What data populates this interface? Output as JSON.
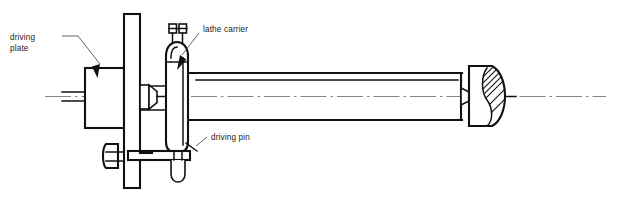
{
  "figure": {
    "type": "engineering-line-drawing",
    "width": 619,
    "height": 199,
    "background_color": "#ffffff",
    "line_color": "#111111",
    "centerline_color": "#777777",
    "leader_color": "#4a4a4a"
  },
  "labels": {
    "driving_plate": {
      "line1": "driving",
      "line2": "plate",
      "full": "driving plate",
      "x": 10,
      "y": 40
    },
    "lathe_carrier": {
      "full": "lathe carrier",
      "x": 203,
      "y": 32
    },
    "driving_pin": {
      "full": "driving pin",
      "x": 211,
      "y": 140
    }
  },
  "components": [
    {
      "name": "driving-plate",
      "description": "tall vertical faceplate mounted on the lathe spindle",
      "shape": "rectangle",
      "x": 124,
      "y": 14,
      "width": 16,
      "height": 174
    },
    {
      "name": "driving-plate-hub",
      "description": "cylindrical hub behind the faceplate",
      "shape": "rectangle",
      "x": 85,
      "y": 68,
      "width": 39,
      "height": 60
    },
    {
      "name": "headstock-center",
      "description": "conical dead center projecting from the spindle",
      "shape": "cone"
    },
    {
      "name": "lathe-carrier",
      "description": "lathe dog clamped onto the workpiece, rounded top body with two clamping screws",
      "shape": "rounded-body",
      "x": 166,
      "y": 43,
      "width": 22,
      "height": 110
    },
    {
      "name": "carrier-clamp-screws",
      "description": "two small square screw heads on top of the lathe carrier",
      "count": 2
    },
    {
      "name": "driving-pin",
      "description": "U-shaped pin on the driving plate that engages the carrier tail",
      "shape": "u-pin"
    },
    {
      "name": "driving-plate-bolt",
      "description": "hex bolt head and bar on the lower left of the faceplate",
      "shape": "bolt"
    },
    {
      "name": "workpiece-shaft",
      "description": "long cylindrical workpiece held between centers",
      "shape": "rectangle",
      "x": 188,
      "y": 72,
      "width": 272,
      "height": 48
    },
    {
      "name": "tailstock-center",
      "description": "tailstock live center with sectioned hatching at the right end",
      "shape": "center-with-hatch",
      "x": 460,
      "y": 66,
      "width": 46,
      "height": 60
    },
    {
      "name": "center-line",
      "description": "dash-dot axis of rotation running the full width",
      "y": 96,
      "x_start": 45,
      "x_end": 606
    }
  ]
}
